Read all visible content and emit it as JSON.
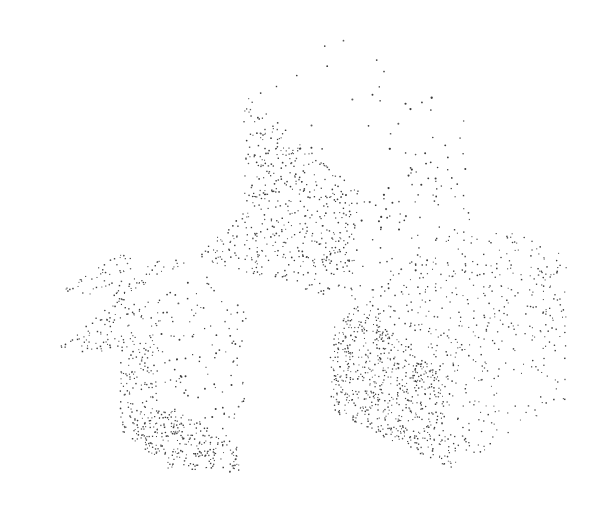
{
  "figure": {
    "title": "Stippled point-density rendering of three blocky solids",
    "caption": "",
    "width": 613,
    "height": 510,
    "background_color": "#ffffff",
    "dot_color": "#3b3b3b",
    "dot_color_light": "#5a5a5a",
    "dot_min_size": 1.0,
    "dot_max_size": 1.9,
    "technique": "stipple"
  },
  "chart_data": {
    "type": "scatter",
    "title": "Stippled point-density rendering of three blocky solids",
    "xlabel": "",
    "ylabel": "",
    "xlim": [
      0,
      613
    ],
    "ylim": [
      0,
      510
    ],
    "grid": false,
    "legend": "none",
    "objects": [
      {
        "name": "upper-solid",
        "description": "Tall block above centre; top face very sparse, left face dense, right face sparse-medium",
        "faces": [
          {
            "name": "upper-top-face",
            "shading": "very-light",
            "density": 0.0016,
            "dot_size": 1.8,
            "polygon": [
              [
                355,
                22
              ],
              [
                243,
                93
              ],
              [
                358,
                190
              ],
              [
                468,
                118
              ]
            ]
          },
          {
            "name": "upper-left-face",
            "shading": "dark",
            "density": 0.03,
            "dot_size": 1.25,
            "polygon": [
              [
                243,
                93
              ],
              [
                358,
                190
              ],
              [
                352,
                300
              ],
              [
                283,
                286
              ],
              [
                196,
                257
              ],
              [
                243,
                210
              ]
            ]
          },
          {
            "name": "upper-right-face",
            "shading": "light",
            "density": 0.0055,
            "dot_size": 1.55,
            "polygon": [
              [
                358,
                190
              ],
              [
                468,
                118
              ],
              [
                470,
                225
              ],
              [
                430,
                262
              ],
              [
                395,
                300
              ],
              [
                352,
                300
              ]
            ]
          }
        ]
      },
      {
        "name": "right-solid",
        "description": "Cube at lower right; top face medium, left/front face very dark, right face medium-light",
        "faces": [
          {
            "name": "right-top-face",
            "shading": "medium",
            "density": 0.016,
            "dot_size": 1.2,
            "polygon": [
              [
                440,
                228
              ],
              [
                356,
                300
              ],
              [
                440,
                372
              ],
              [
                566,
                290
              ],
              [
                566,
                255
              ],
              [
                520,
                232
              ]
            ]
          },
          {
            "name": "right-front-face",
            "shading": "very-dark",
            "density": 0.055,
            "dot_size": 1.15,
            "polygon": [
              [
                356,
                300
              ],
              [
                440,
                372
              ],
              [
                452,
                470
              ],
              [
                372,
                432
              ],
              [
                330,
                410
              ],
              [
                330,
                330
              ]
            ]
          },
          {
            "name": "right-side-face",
            "shading": "medium-light",
            "density": 0.014,
            "dot_size": 1.2,
            "polygon": [
              [
                440,
                372
              ],
              [
                566,
                290
              ],
              [
                566,
                398
              ],
              [
                452,
                470
              ]
            ]
          }
        ]
      },
      {
        "name": "left-solid",
        "description": "Notched block at lower left; upper sliver dark, interior face light, lower face dark",
        "faces": [
          {
            "name": "left-upper-sliver",
            "shading": "dark",
            "density": 0.03,
            "dot_size": 1.2,
            "polygon": [
              [
                196,
                257
              ],
              [
                120,
                296
              ],
              [
                53,
                292
              ],
              [
                122,
                253
              ],
              [
                165,
                262
              ]
            ]
          },
          {
            "name": "left-inner-face",
            "shading": "light",
            "density": 0.0085,
            "dot_size": 1.4,
            "polygon": [
              [
                196,
                262
              ],
              [
                160,
                300
              ],
              [
                160,
                400
              ],
              [
                237,
                443
              ],
              [
                247,
                382
              ],
              [
                247,
                300
              ]
            ]
          },
          {
            "name": "left-front-face",
            "shading": "dark",
            "density": 0.032,
            "dot_size": 1.2,
            "polygon": [
              [
                160,
                300
              ],
              [
                120,
                296
              ],
              [
                55,
                350
              ],
              [
                120,
                352
              ],
              [
                120,
                430
              ],
              [
                168,
                468
              ],
              [
                237,
                470
              ],
              [
                237,
                443
              ],
              [
                160,
                400
              ]
            ]
          },
          {
            "name": "left-bottom-face",
            "shading": "dark",
            "density": 0.028,
            "dot_size": 1.2,
            "polygon": [
              [
                160,
                400
              ],
              [
                237,
                443
              ],
              [
                240,
                472
              ],
              [
                168,
                468
              ],
              [
                120,
                430
              ]
            ]
          }
        ]
      }
    ]
  }
}
